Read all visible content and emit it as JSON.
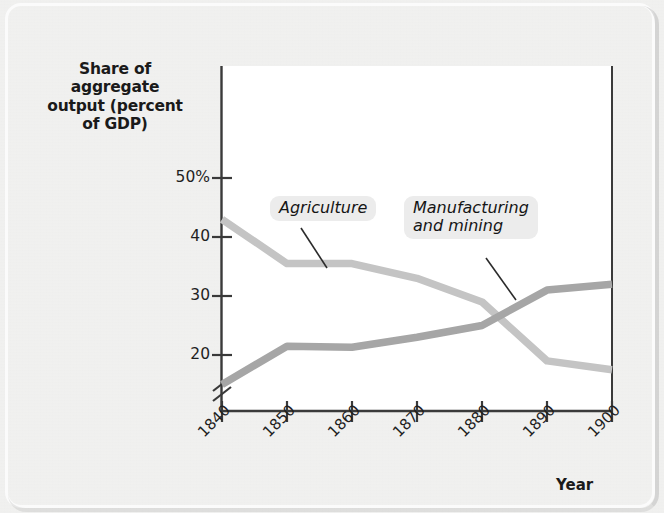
{
  "figure": {
    "background_color": "#e6e6e4",
    "plot_background_color": "#ffffff",
    "frame_color": "#fbfbfb"
  },
  "chart_data": {
    "type": "line",
    "title": "",
    "subtitle": "",
    "xlabel": "Year",
    "ylabel": "Share of aggregate output (percent of GDP)",
    "ylabel_lines": [
      "Share of",
      "aggregate",
      "output (percent",
      "of GDP)"
    ],
    "x": [
      1840,
      1850,
      1860,
      1870,
      1880,
      1890,
      1900
    ],
    "categories": [
      "1840",
      "1850",
      "1860",
      "1870",
      "1880",
      "1890",
      "1900"
    ],
    "xtick_labels": [
      "1840",
      "1850",
      "1860",
      "1870",
      "1880",
      "1890",
      "1900"
    ],
    "xtick_rotation": -45,
    "ytick_labels": [
      "50%",
      "40",
      "30",
      "20"
    ],
    "ytick_values": [
      50,
      40,
      30,
      20
    ],
    "ylim": [
      14,
      53
    ],
    "xlim": [
      1838,
      1902
    ],
    "y_axis_break": true,
    "y_axis_break_note": "axis broken below 20",
    "grid": false,
    "legend_position": "inline-callout",
    "series": [
      {
        "name": "Agriculture",
        "color": "#c4c4c4",
        "values": [
          43,
          35.5,
          35.5,
          33,
          29,
          19,
          17.5
        ]
      },
      {
        "name": "Manufacturing and mining",
        "color": "#a6a6a6",
        "values": [
          15,
          21.5,
          21.3,
          23,
          25,
          31,
          32
        ]
      }
    ],
    "annotations": [
      {
        "text": "Agriculture",
        "text_lines": [
          "Agriculture"
        ],
        "points_to_series": "Agriculture",
        "points_to_x": 1857
      },
      {
        "text": "Manufacturing and mining",
        "text_lines": [
          "Manufacturing",
          "and mining"
        ],
        "points_to_series": "Manufacturing and mining",
        "points_to_x": 1886
      }
    ]
  }
}
